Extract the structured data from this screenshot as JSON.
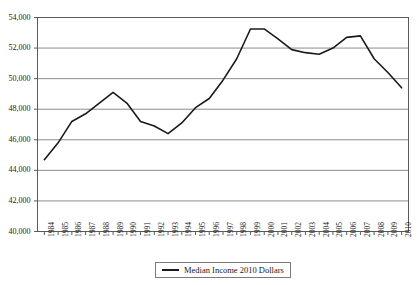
{
  "chart_data": {
    "type": "line",
    "title": "",
    "xlabel": "",
    "ylabel": "",
    "grid": true,
    "legend_position": "bottom",
    "ylim": [
      40000,
      54000
    ],
    "ytick_step": 2000,
    "ytick_labels": [
      "54,000",
      "52,000",
      "50,000",
      "48,000",
      "46,000",
      "44,000",
      "42,000",
      "40,000"
    ],
    "ytick_values": [
      54000,
      52000,
      50000,
      48000,
      46000,
      44000,
      42000,
      40000
    ],
    "categories": [
      "1984",
      "1985",
      "1986",
      "1987",
      "1988",
      "1989",
      "1990",
      "1991",
      "1992",
      "1993",
      "1994",
      "1995",
      "1996",
      "1997",
      "1998",
      "1999",
      "2000",
      "2001",
      "2002",
      "2003",
      "2004",
      "2005",
      "2006",
      "2007",
      "2008",
      "2009",
      "2010"
    ],
    "series": [
      {
        "name": "Median Income 2010 Dollars",
        "color": "#1a1a1a",
        "values": [
          44700,
          45800,
          47200,
          47700,
          48400,
          49100,
          48400,
          47200,
          46900,
          46400,
          47100,
          48100,
          48700,
          49900,
          51300,
          53250,
          53250,
          52600,
          51900,
          51700,
          51600,
          52000,
          52700,
          52800,
          51300,
          50400,
          49400
        ]
      }
    ]
  },
  "legend": {
    "entries": [
      {
        "label": "Median Income 2010 Dollars"
      }
    ]
  }
}
